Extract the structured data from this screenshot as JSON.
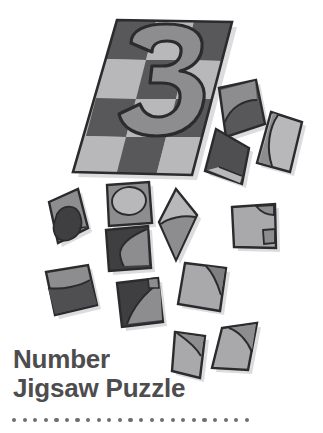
{
  "canvas": {
    "width": 323,
    "height": 433,
    "background": "#ffffff"
  },
  "title": {
    "line1": "Number",
    "line2": "Jigsaw Puzzle",
    "color": "#4d4d4f"
  },
  "decoration": {
    "dots": {
      "count": 23,
      "color": "#6e6e70",
      "diameter": 4.2,
      "spacing": 10.6
    }
  },
  "palette": {
    "dark_gray": "#58585a",
    "mid_gray": "#8d8d8f",
    "light_gray": "#b8b8ba",
    "outline": "#2b2b2d",
    "shadow": "#d9d9db",
    "white": "#ffffff"
  },
  "illustration": {
    "subject": "jigsaw-puzzle-with-numeral-three",
    "board": {
      "name": "puzzle-board",
      "numeral": "3",
      "numeral_fill": "#8d8d8f",
      "corners": [
        [
          117,
          20
        ],
        [
          232,
          22
        ],
        [
          192,
          175
        ],
        [
          73,
          172
        ]
      ],
      "checker_rows": 4,
      "checker_cols": 3,
      "checker_dark": "#58585a",
      "checker_light": "#b8b8ba"
    },
    "loose_pieces": [
      {
        "name": "piece-top-right-dark-curve",
        "fill": "#58585a",
        "accent": "#8d8d8f",
        "points": "219,88 256,80 265,124 226,137",
        "accent_points": "222,90 254,81 256,99 238,102 226,112 223,120"
      },
      {
        "name": "piece-right-light-tall",
        "fill": "#b8b8ba",
        "accent": "#8d8d8f",
        "points": "271,112 302,122 290,172 257,163",
        "accent_points": "277,114 300,122 289,170 272,166 268,146 272,128"
      },
      {
        "name": "piece-mid-dark-diamond",
        "fill": "#4f4f51",
        "accent": "#b8b8ba",
        "points": "216,129 249,148 242,184 205,171",
        "accent_points": "210,172 240,183 242,176 219,168"
      },
      {
        "name": "piece-left-dark-blob",
        "fill": "#8d8d8f",
        "accent": "#3f3f41",
        "points": "49,202 78,189 88,228 58,243",
        "accent_points": "58,213 72,206 80,216 79,233 62,239 55,226"
      },
      {
        "name": "piece-upper-mid-oval",
        "fill": "#8d8d8f",
        "accent": "#b8b8ba",
        "points": "107,185 149,182 152,223 109,226",
        "accent_points": "116,191 138,188 146,199 141,213 122,215 113,204"
      },
      {
        "name": "piece-mid-dark-window",
        "fill": "#3f3f41",
        "accent": "#8d8d8f",
        "points": "106,230 148,226 151,268 109,271",
        "accent_points": "124,241 148,228 150,265 123,266 118,252"
      },
      {
        "name": "piece-center-diamond",
        "fill": "#b8b8ba",
        "accent": "#8d8d8f",
        "points": "176,189 197,215 176,260 159,222",
        "accent_points": "164,222 194,217 176,258 161,228"
      },
      {
        "name": "piece-right-light-notch",
        "fill": "#a9a9ab",
        "accent": "#8d8d8f",
        "points": "232,207 275,204 276,248 234,247",
        "accent_points": "258,208 274,205 274,214 261,216"
      },
      {
        "name": "piece-left-two-tone",
        "fill": "#8d8d8f",
        "accent": "#4f4f51",
        "points": "46,272 88,265 97,305 55,315",
        "accent_points": "50,292 92,285 97,304 55,314"
      },
      {
        "name": "piece-lower-dark-curve",
        "fill": "#3f3f41",
        "accent": "#8d8d8f",
        "points": "117,283 158,278 163,322 122,327",
        "accent_points": "136,318 160,280 162,320 125,325"
      },
      {
        "name": "piece-lower-light-corner",
        "fill": "#a9a9ab",
        "accent": "#7f7f81",
        "points": "185,263 226,268 220,311 178,304",
        "accent_points": "208,270 225,269 221,292 206,284"
      },
      {
        "name": "piece-bottom-right-arc",
        "fill": "#a9a9ab",
        "accent": "#8d8d8f",
        "points": "222,328 257,323 248,370 212,368",
        "accent_points": "230,328 256,324 251,346 236,340"
      },
      {
        "name": "piece-bottom-small",
        "fill": "#a9a9ab",
        "accent": "#8d8d8f",
        "points": "175,332 205,336 200,378 172,371",
        "accent_points": "178,334 203,337 200,352 182,345"
      }
    ]
  }
}
